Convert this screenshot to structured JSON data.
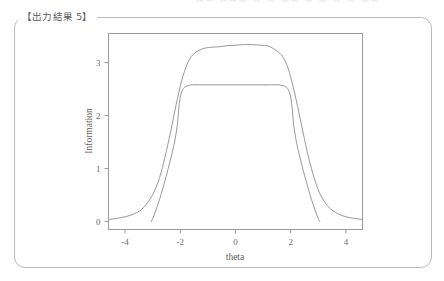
{
  "header": {
    "faint_text": "——  ——— —  — —— — —   —   —  ——"
  },
  "panel": {
    "legend_label": "【出力結果 5】"
  },
  "chart_data": {
    "type": "line",
    "title": "",
    "xlabel": "theta",
    "ylabel": "Information",
    "xlim": [
      -4.6,
      4.6
    ],
    "ylim": [
      -0.15,
      3.55
    ],
    "xticks": [
      -4,
      -2,
      0,
      2,
      4
    ],
    "xtick_labels": [
      "-4",
      "-2",
      "0",
      "2",
      "4"
    ],
    "yticks": [
      0,
      1,
      2,
      3
    ],
    "ytick_labels": [
      "0",
      "1",
      "2",
      "3"
    ],
    "grid": false,
    "legend_position": "none",
    "line_color": "#8b8c90",
    "frame_color": "#9a9b9f",
    "series": [
      {
        "name": "test-information-smooth",
        "x": [
          -4.6,
          -4.3,
          -4.0,
          -3.7,
          -3.4,
          -3.1,
          -2.9,
          -2.7,
          -2.5,
          -2.3,
          -2.1,
          -1.9,
          -1.7,
          -1.5,
          -1.2,
          -0.9,
          -0.6,
          -0.3,
          0.0,
          0.3,
          0.6,
          0.9,
          1.2,
          1.5,
          1.7,
          1.9,
          2.1,
          2.3,
          2.5,
          2.7,
          2.9,
          3.1,
          3.4,
          3.7,
          4.0,
          4.3,
          4.6
        ],
        "y": [
          0.04,
          0.06,
          0.09,
          0.14,
          0.23,
          0.42,
          0.62,
          0.92,
          1.34,
          1.82,
          2.33,
          2.75,
          3.03,
          3.17,
          3.26,
          3.29,
          3.3,
          3.32,
          3.33,
          3.34,
          3.34,
          3.33,
          3.31,
          3.22,
          3.12,
          2.9,
          2.52,
          2.05,
          1.55,
          1.1,
          0.74,
          0.48,
          0.26,
          0.15,
          0.09,
          0.06,
          0.04
        ]
      },
      {
        "name": "test-information-flat",
        "x": [
          -3.05,
          -2.95,
          -2.75,
          -2.55,
          -2.35,
          -2.2,
          -2.1,
          -2.05,
          -1.95,
          -1.7,
          -1.0,
          0.0,
          1.0,
          1.7,
          1.95,
          2.05,
          2.1,
          2.2,
          2.35,
          2.55,
          2.75,
          2.95,
          3.05
        ],
        "y": [
          0.0,
          0.12,
          0.42,
          0.78,
          1.18,
          1.52,
          1.85,
          2.15,
          2.45,
          2.57,
          2.58,
          2.58,
          2.58,
          2.57,
          2.45,
          2.15,
          1.85,
          1.52,
          1.18,
          0.78,
          0.42,
          0.12,
          0.0
        ]
      }
    ]
  }
}
